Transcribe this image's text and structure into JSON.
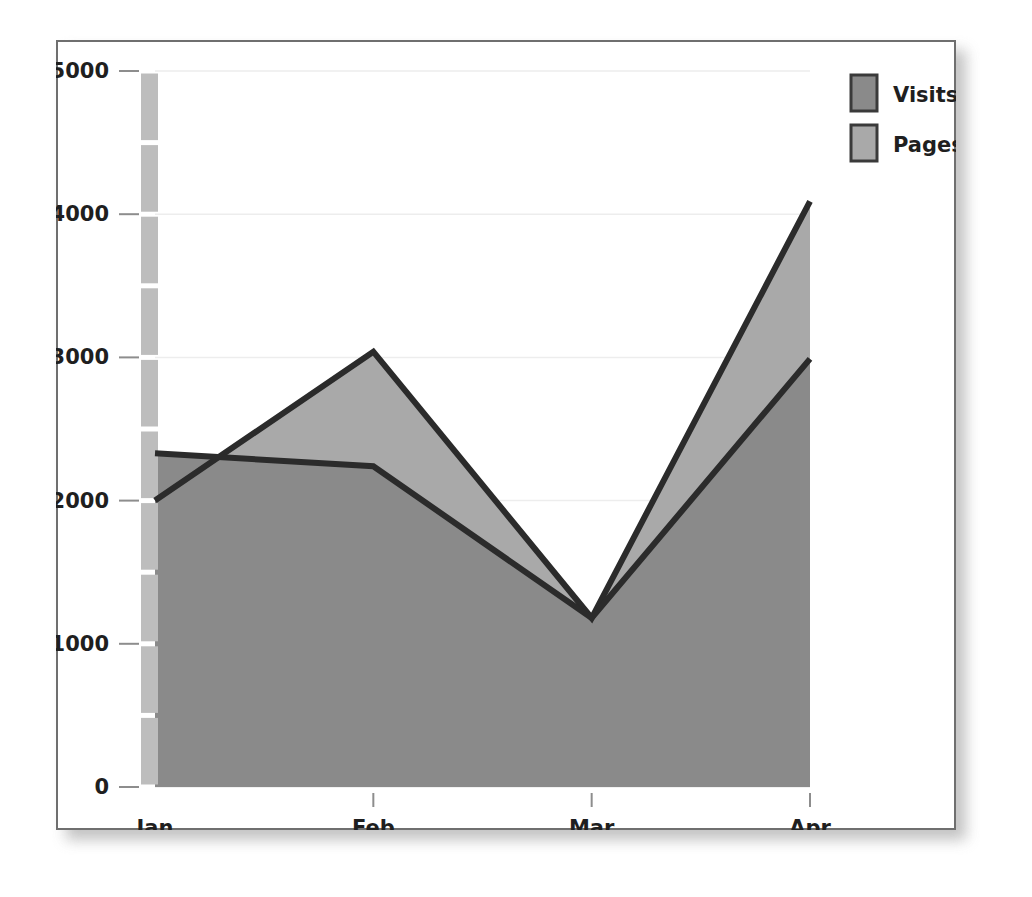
{
  "chart_data": {
    "type": "area",
    "title": "",
    "subtitle": "",
    "xlabel": "",
    "ylabel": "",
    "categories": [
      "Jan",
      "Feb",
      "Mar",
      "Apr"
    ],
    "series": [
      {
        "name": "Visits",
        "values": [
          2330,
          2240,
          1180,
          2990
        ],
        "color": "#8a8a8a"
      },
      {
        "name": "Pages",
        "values": [
          2000,
          3040,
          1180,
          4090
        ],
        "color": "#a9a9a9"
      }
    ],
    "ylim": [
      0,
      5000
    ],
    "ytick_values": [
      0,
      1000,
      2000,
      3000,
      4000,
      5000
    ],
    "ytick_labels": [
      "0",
      "1000",
      "2000",
      "3000",
      "4000",
      "5000"
    ],
    "yminor_step": 500,
    "grid": true,
    "grid_axis": "y",
    "legend_position": "top-right",
    "line_color": "#2b2b2b",
    "axis_band_color": "#bdbdbd",
    "background": "#ffffff",
    "frame_color": "#6f6f6f"
  },
  "legend": {
    "entries": [
      {
        "label": "Visits",
        "color": "#8a8a8a"
      },
      {
        "label": "Pages",
        "color": "#a9a9a9"
      }
    ]
  },
  "axes": {
    "y_labels": [
      "5000",
      "4000",
      "3000",
      "2000",
      "1000",
      "0"
    ],
    "x_labels": [
      "Jan",
      "Feb",
      "Mar",
      "Apr"
    ]
  }
}
